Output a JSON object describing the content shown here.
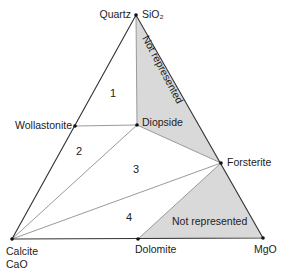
{
  "diagram": {
    "type": "ternary-phase-diagram",
    "vertices": {
      "top": {
        "label": "Quartz",
        "formula": "SiO₂"
      },
      "left": {
        "label": "Calcite",
        "formula": "CaO"
      },
      "right": {
        "label": "MgO"
      }
    },
    "points": {
      "wollastonite": "Wollastonite",
      "diopside": "Diopside",
      "forsterite": "Forsterite",
      "dolomite": "Dolomite"
    },
    "regions": {
      "r1": "1",
      "r2": "2",
      "r3": "3",
      "r4": "4"
    },
    "shaded": {
      "upper": "Not represented",
      "lower": "Not represented"
    },
    "colors": {
      "shade": "#d9d9d9",
      "outline": "#333333",
      "tieline": "#9a9a9a"
    }
  }
}
